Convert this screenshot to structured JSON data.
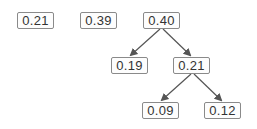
{
  "diagram": {
    "type": "tree",
    "nodes": [
      {
        "id": "n1",
        "label": "0.21",
        "x": 17,
        "y": 12
      },
      {
        "id": "n2",
        "label": "0.39",
        "x": 80,
        "y": 12
      },
      {
        "id": "n3",
        "label": "0.40",
        "x": 143,
        "y": 12
      },
      {
        "id": "n4",
        "label": "0.19",
        "x": 111,
        "y": 57
      },
      {
        "id": "n5",
        "label": "0.21",
        "x": 173,
        "y": 57
      },
      {
        "id": "n6",
        "label": "0.09",
        "x": 142,
        "y": 102
      },
      {
        "id": "n7",
        "label": "0.12",
        "x": 204,
        "y": 102
      }
    ],
    "edges": [
      {
        "from": "n3",
        "to": "n4"
      },
      {
        "from": "n3",
        "to": "n5"
      },
      {
        "from": "n5",
        "to": "n6"
      },
      {
        "from": "n5",
        "to": "n7"
      }
    ],
    "colors": {
      "border": "#8a8a8a",
      "text": "#333333",
      "arrow": "#555555"
    }
  }
}
